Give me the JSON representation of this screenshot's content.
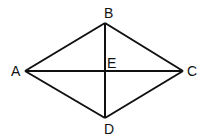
{
  "diagram": {
    "type": "rhombus-with-diagonals",
    "stroke_color": "#111111",
    "vertices": {
      "A": {
        "label": "A",
        "x": 25,
        "y": 71
      },
      "B": {
        "label": "B",
        "x": 105,
        "y": 23
      },
      "C": {
        "label": "C",
        "x": 183,
        "y": 71
      },
      "D": {
        "label": "D",
        "x": 105,
        "y": 118
      },
      "E": {
        "label": "E",
        "x": 105,
        "y": 71
      }
    },
    "segments": [
      "AB",
      "BC",
      "CD",
      "DA",
      "AC",
      "BD"
    ]
  }
}
